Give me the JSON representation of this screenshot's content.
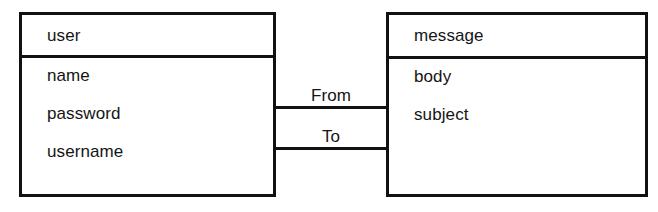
{
  "diagram": {
    "kind": "uml-class-diagram",
    "background_color": "#ffffff",
    "stroke_color": "#111111",
    "text_color": "#151515"
  },
  "classes": [
    {
      "id": "user",
      "name": "user",
      "attributes": [
        "name",
        "password",
        "username"
      ]
    },
    {
      "id": "message",
      "name": "message",
      "attributes": [
        "body",
        "subject"
      ]
    }
  ],
  "association": {
    "source": "user",
    "target": "message",
    "roles": [
      {
        "id": "from",
        "label": "From"
      },
      {
        "id": "to",
        "label": "To"
      }
    ]
  }
}
